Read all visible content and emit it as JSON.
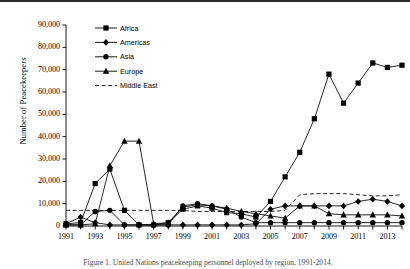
{
  "figure": {
    "ylabel": "Number of Peacekeepers",
    "caption": "Figure 1. United Nations peacekeeping personnel deployed by region, 1991-2014."
  },
  "legend": {
    "position": "upper-left-inside",
    "entries": [
      {
        "label": "Africa",
        "marker": "square",
        "style": "solid"
      },
      {
        "label": "Americas",
        "marker": "diamond",
        "style": "solid"
      },
      {
        "label": "Asia",
        "marker": "circle",
        "style": "solid"
      },
      {
        "label": "Europe",
        "marker": "triangle",
        "style": "solid"
      },
      {
        "label": "Middle East",
        "marker": "none",
        "style": "dashed"
      }
    ]
  },
  "axes": {
    "ytick_labels": [
      "90,000",
      "80,000",
      "70,000",
      "60,000",
      "50,000",
      "40,000",
      "30,000",
      "20,000",
      "10,000",
      "0"
    ],
    "xtick_labels": [
      "1991",
      "1993",
      "1995",
      "1997",
      "1999",
      "2001",
      "2003",
      "2005",
      "2007",
      "2009",
      "2011",
      "2013"
    ]
  },
  "colors": {
    "ink": "#000000",
    "background": "#ffffff",
    "rule": "#2b2b2b"
  },
  "chart_data": {
    "type": "line",
    "title": "",
    "xlabel": "",
    "ylabel": "Number of Peacekeepers",
    "xlim": [
      1991,
      2014
    ],
    "ylim": [
      0,
      90000
    ],
    "ytick_step": 10000,
    "xtick_step": 1,
    "xtick_labeled_step": 2,
    "grid": false,
    "legend_position": "upper left",
    "x": [
      1991,
      1992,
      1993,
      1994,
      1995,
      1996,
      1997,
      1998,
      1999,
      2000,
      2001,
      2002,
      2003,
      2004,
      2005,
      2006,
      2007,
      2008,
      2009,
      2010,
      2011,
      2012,
      2013,
      2014
    ],
    "series": [
      {
        "name": "Africa",
        "marker": "square",
        "linestyle": "solid",
        "values": [
          1000,
          1500,
          19000,
          25500,
          7000,
          500,
          500,
          1500,
          7500,
          9000,
          8000,
          6000,
          5500,
          4000,
          11000,
          22000,
          33000,
          48000,
          68000,
          55000,
          64000,
          73000,
          71000,
          72000
        ]
      },
      {
        "name": "Americas",
        "marker": "diamond",
        "linestyle": "solid",
        "values": [
          1000,
          4000,
          1500,
          500,
          500,
          500,
          500,
          500,
          500,
          500,
          500,
          500,
          500,
          1000,
          7500,
          9000,
          9000,
          9000,
          9000,
          9000,
          11000,
          12000,
          11000,
          9000
        ]
      },
      {
        "name": "Asia",
        "marker": "circle",
        "linestyle": "solid",
        "values": [
          500,
          500,
          6500,
          7000,
          500,
          500,
          500,
          500,
          9000,
          10000,
          9000,
          7500,
          4000,
          1500,
          1500,
          1500,
          1500,
          1500,
          1500,
          1500,
          1500,
          1500,
          1500,
          1500
        ]
      },
      {
        "name": "Europe",
        "marker": "triangle",
        "linestyle": "solid",
        "values": [
          500,
          500,
          1000,
          27000,
          38000,
          38000,
          1000,
          1500,
          8500,
          9500,
          9000,
          8000,
          6500,
          5500,
          4500,
          3500,
          9000,
          9000,
          5500,
          5000,
          5000,
          5000,
          5000,
          4500
        ]
      },
      {
        "name": "Middle East",
        "marker": "none",
        "linestyle": "dashed",
        "values": [
          7000,
          7000,
          7000,
          7000,
          7000,
          7000,
          7000,
          7000,
          7000,
          6500,
          6500,
          6500,
          6500,
          6500,
          6500,
          7000,
          14000,
          14500,
          14500,
          14500,
          14000,
          13500,
          13500,
          14000
        ]
      }
    ]
  }
}
